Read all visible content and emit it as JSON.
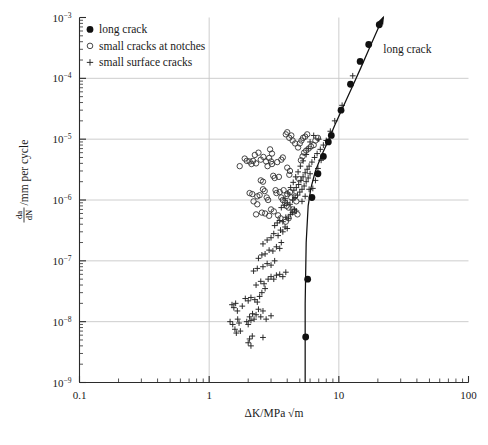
{
  "chart_data": {
    "type": "scatter",
    "title": "",
    "xlabel": "ΔK/MPa √m",
    "ylabel": "da/dN / mm per cycle",
    "ylabel_numerator": "da",
    "ylabel_denominator": "dN",
    "ylabel_suffix": "/mm per cycle",
    "xscale": "log",
    "yscale": "log",
    "xlim": [
      0.1,
      100
    ],
    "ylim": [
      1e-09,
      0.001
    ],
    "grid": "major-only-light-gray",
    "grid_color": "#c8c8c8",
    "axis_color": "#2b2b2b",
    "xticks": [
      {
        "value": 0.1,
        "label": "0.1"
      },
      {
        "value": 1,
        "label": "1"
      },
      {
        "value": 10,
        "label": "10"
      },
      {
        "value": 100,
        "label": "100"
      }
    ],
    "yticks": [
      {
        "value": 0.001,
        "mantissa": "10",
        "exponent": "−3"
      },
      {
        "value": 0.0001,
        "mantissa": "10",
        "exponent": "−4"
      },
      {
        "value": 1e-05,
        "mantissa": "10",
        "exponent": "−5"
      },
      {
        "value": 1e-06,
        "mantissa": "10",
        "exponent": "−6"
      },
      {
        "value": 1e-07,
        "mantissa": "10",
        "exponent": "−7"
      },
      {
        "value": 1e-08,
        "mantissa": "10",
        "exponent": "−8"
      },
      {
        "value": 1e-09,
        "mantissa": "10",
        "exponent": "−9"
      }
    ],
    "legend": {
      "position": "top-left-inside",
      "entries": [
        {
          "marker": "filled-circle",
          "label": "long crack"
        },
        {
          "marker": "open-circle",
          "label": "small cracks at notches"
        },
        {
          "marker": "plus",
          "label": "small surface cracks"
        }
      ]
    },
    "annotations": [
      {
        "text": "long crack",
        "x": 22.0,
        "y": 0.00026,
        "points_to": "long-crack-curve"
      }
    ],
    "series": [
      {
        "name": "long crack",
        "marker": "filled-circle",
        "points": [
          [
            5.55,
            5.6e-09
          ],
          [
            5.75,
            5e-08
          ],
          [
            6.2,
            1.1e-06
          ],
          [
            6.9,
            2.7e-06
          ],
          [
            7.6,
            5.2e-06
          ],
          [
            8.3,
            9e-06
          ],
          [
            8.75,
            1.15e-05
          ],
          [
            10.4,
            3e-05
          ],
          [
            12.3,
            8e-05
          ],
          [
            14.6,
            0.00019
          ],
          [
            17.0,
            0.00036
          ],
          [
            20.5,
            0.00076
          ]
        ]
      },
      {
        "name": "long crack fit curve",
        "marker": "line",
        "points": [
          [
            5.5,
            1e-09
          ],
          [
            5.5,
            2e-08
          ],
          [
            5.6,
            2e-07
          ],
          [
            5.8,
            8e-07
          ],
          [
            6.1,
            1.6e-06
          ],
          [
            6.6,
            3e-06
          ],
          [
            7.3,
            5.2e-06
          ],
          [
            8.2,
            9e-06
          ],
          [
            9.3,
            1.7e-05
          ],
          [
            10.8,
            3.4e-05
          ],
          [
            12.6,
            7e-05
          ],
          [
            14.8,
            0.00015
          ],
          [
            17.4,
            0.00033
          ],
          [
            20.0,
            0.00065
          ],
          [
            22.0,
            0.001
          ]
        ]
      },
      {
        "name": "small cracks at notches",
        "marker": "open-circle",
        "points": [
          [
            1.72,
            3.6e-06
          ],
          [
            1.95,
            4.4e-06
          ],
          [
            2.05,
            4.3e-06
          ],
          [
            2.18,
            4.4e-06
          ],
          [
            2.3,
            4e-06
          ],
          [
            2.5,
            4.6e-06
          ],
          [
            2.62,
            5.1e-06
          ],
          [
            2.75,
            4.3e-06
          ],
          [
            2.82,
            3.6e-06
          ],
          [
            2.9,
            4.9e-06
          ],
          [
            3.0,
            4.3e-06
          ],
          [
            3.05,
            3.9e-06
          ],
          [
            3.12,
            2.5e-06
          ],
          [
            3.2,
            2.3e-06
          ],
          [
            3.25,
            1.45e-06
          ],
          [
            3.3,
            1.3e-06
          ],
          [
            3.45,
            2.4e-06
          ],
          [
            3.5,
            1.35e-06
          ],
          [
            3.6,
            1.1e-06
          ],
          [
            3.7,
            1e-06
          ],
          [
            3.75,
            1.45e-06
          ],
          [
            3.85,
            9e-07
          ],
          [
            3.95,
            8e-07
          ],
          [
            4.0,
            1.25e-06
          ],
          [
            4.1,
            7.5e-07
          ],
          [
            4.2,
            1.35e-06
          ],
          [
            4.3,
            1.1e-06
          ],
          [
            4.4,
            7e-07
          ],
          [
            4.5,
            6.5e-07
          ],
          [
            4.6,
            1.15e-06
          ],
          [
            4.7,
            9.5e-07
          ],
          [
            4.8,
            5.8e-07
          ],
          [
            2.6,
            1.5e-06
          ],
          [
            2.68,
            1.4e-06
          ],
          [
            2.78,
            1.1e-06
          ],
          [
            2.85,
            1e-06
          ],
          [
            2.45,
            1.2e-06
          ],
          [
            2.35,
            1.15e-06
          ],
          [
            2.55,
            6.2e-07
          ],
          [
            2.7,
            6e-07
          ],
          [
            3.0,
            7e-07
          ],
          [
            3.15,
            6.5e-07
          ],
          [
            2.9,
            5.5e-07
          ],
          [
            3.4,
            5.6e-07
          ],
          [
            3.55,
            5e-07
          ],
          [
            4.95,
            2.2e-06
          ],
          [
            5.1,
            4.5e-06
          ],
          [
            5.25,
            5.2e-06
          ],
          [
            5.4,
            6e-06
          ],
          [
            5.6,
            6.5e-06
          ],
          [
            5.85,
            7e-06
          ],
          [
            6.1,
            7.6e-06
          ],
          [
            6.4,
            8e-06
          ],
          [
            4.85,
            7.3e-06
          ],
          [
            5.0,
            8.5e-06
          ],
          [
            5.15,
            9.5e-06
          ],
          [
            5.3,
            1.05e-05
          ],
          [
            5.5,
            1.1e-05
          ],
          [
            5.7,
            1.2e-05
          ],
          [
            4.6,
            8.5e-06
          ],
          [
            4.4,
            9.5e-06
          ],
          [
            4.3,
            1.15e-05
          ],
          [
            4.15,
            1.05e-05
          ],
          [
            4.0,
            1.3e-05
          ],
          [
            3.9,
            1.2e-05
          ],
          [
            2.25,
            5.5e-06
          ],
          [
            2.4,
            6e-06
          ],
          [
            1.88,
            4.8e-06
          ],
          [
            2.12,
            3.9e-06
          ],
          [
            3.35,
            4.2e-06
          ],
          [
            3.6,
            4.6e-06
          ],
          [
            3.7,
            5e-06
          ],
          [
            2.95,
            6.8e-06
          ],
          [
            3.05,
            5.8e-06
          ],
          [
            6.6,
            9.5e-06
          ],
          [
            6.9,
            1.05e-05
          ],
          [
            4.0,
            3.4e-06
          ],
          [
            4.2,
            3e-06
          ],
          [
            4.15,
            2.6e-06
          ],
          [
            2.05,
            1.3e-06
          ],
          [
            2.15,
            1.25e-06
          ],
          [
            2.3,
            5.8e-07
          ],
          [
            3.9,
            4.4e-07
          ],
          [
            4.1,
            5e-07
          ],
          [
            2.2,
            9.5e-07
          ],
          [
            2.35,
            8.5e-07
          ],
          [
            2.5,
            2.1e-06
          ],
          [
            2.6,
            2e-06
          ]
        ]
      },
      {
        "name": "small surface cracks",
        "marker": "plus",
        "points": [
          [
            1.52,
            9e-09
          ],
          [
            1.58,
            7.5e-09
          ],
          [
            1.62,
            6.5e-09
          ],
          [
            1.66,
            1.1e-08
          ],
          [
            1.7,
            9.5e-09
          ],
          [
            1.74,
            7e-09
          ],
          [
            1.95,
            1e-08
          ],
          [
            2.0,
            9e-09
          ],
          [
            2.05,
            1.2e-08
          ],
          [
            2.1,
            1.05e-08
          ],
          [
            2.16,
            1.35e-08
          ],
          [
            2.22,
            1.1e-08
          ],
          [
            2.3,
            1.3e-08
          ],
          [
            2.4,
            1.6e-08
          ],
          [
            2.5,
            1.2e-08
          ],
          [
            2.6,
            1.5e-08
          ],
          [
            2.75,
            1.1e-08
          ],
          [
            3.0,
            1.25e-08
          ],
          [
            2.25,
            2.3e-08
          ],
          [
            2.35,
            2.1e-08
          ],
          [
            2.45,
            2.6e-08
          ],
          [
            2.1,
            2.5e-08
          ],
          [
            2.0,
            2.2e-08
          ],
          [
            2.55,
            3e-08
          ],
          [
            2.7,
            3.5e-08
          ],
          [
            2.3,
            4e-08
          ],
          [
            2.5,
            4.6e-08
          ],
          [
            2.65,
            4.2e-08
          ],
          [
            2.85,
            5e-08
          ],
          [
            3.0,
            5.5e-08
          ],
          [
            3.15,
            5e-08
          ],
          [
            3.3,
            5.8e-08
          ],
          [
            3.5,
            6e-08
          ],
          [
            3.7,
            5.5e-08
          ],
          [
            3.9,
            6.5e-08
          ],
          [
            2.2,
            6.8e-08
          ],
          [
            2.35,
            7.5e-08
          ],
          [
            2.6,
            8e-08
          ],
          [
            2.8,
            9e-08
          ],
          [
            3.0,
            8.5e-08
          ],
          [
            3.2,
            1e-07
          ],
          [
            2.4,
            1.1e-07
          ],
          [
            2.55,
            1.25e-07
          ],
          [
            2.7,
            1.3e-07
          ],
          [
            2.9,
            1.5e-07
          ],
          [
            3.1,
            1.45e-07
          ],
          [
            3.3,
            1.7e-07
          ],
          [
            3.5,
            1.6e-07
          ],
          [
            3.6,
            2e-07
          ],
          [
            2.6,
            1.9e-07
          ],
          [
            2.8,
            2.2e-07
          ],
          [
            3.0,
            2.4e-07
          ],
          [
            3.15,
            2.8e-07
          ],
          [
            3.4,
            2.6e-07
          ],
          [
            3.55,
            3.2e-07
          ],
          [
            3.7,
            3e-07
          ],
          [
            3.85,
            3.6e-07
          ],
          [
            4.0,
            3.4e-07
          ],
          [
            3.2,
            3.8e-07
          ],
          [
            3.35,
            4.2e-07
          ],
          [
            3.5,
            4.6e-07
          ],
          [
            3.7,
            4.4e-07
          ],
          [
            3.9,
            5.2e-07
          ],
          [
            4.1,
            5e-07
          ],
          [
            4.25,
            5.8e-07
          ],
          [
            4.4,
            6.2e-07
          ],
          [
            4.55,
            7e-07
          ],
          [
            4.7,
            6.6e-07
          ],
          [
            3.6,
            7.5e-07
          ],
          [
            3.8,
            8.2e-07
          ],
          [
            4.0,
            9e-07
          ],
          [
            4.2,
            8.5e-07
          ],
          [
            4.4,
            1e-06
          ],
          [
            4.6,
            1.1e-06
          ],
          [
            4.8,
            1.2e-06
          ],
          [
            5.0,
            1.35e-06
          ],
          [
            5.2,
            1.5e-06
          ],
          [
            5.4,
            1.7e-06
          ],
          [
            5.6,
            2e-06
          ],
          [
            5.8,
            2.3e-06
          ],
          [
            6.0,
            2.7e-06
          ],
          [
            4.5,
            1.45e-06
          ],
          [
            4.7,
            1.6e-06
          ],
          [
            4.9,
            1.8e-06
          ],
          [
            5.1,
            2.1e-06
          ],
          [
            5.3,
            2.4e-06
          ],
          [
            5.5,
            2.8e-06
          ],
          [
            5.7,
            3.2e-06
          ],
          [
            5.9,
            3.6e-06
          ],
          [
            6.2,
            4.2e-06
          ],
          [
            6.5,
            5e-06
          ],
          [
            6.8,
            5.8e-06
          ],
          [
            7.2,
            6.8e-06
          ],
          [
            7.6,
            8e-06
          ],
          [
            8.0,
            9.5e-06
          ],
          [
            9.3,
            2e-05
          ],
          [
            10.6,
            3.6e-05
          ],
          [
            12.8,
            0.00011
          ],
          [
            8.6,
            1.35e-05
          ],
          [
            7.0,
            1e-05
          ],
          [
            6.4,
            1.15e-05
          ],
          [
            6.0,
            9e-06
          ],
          [
            5.8,
            7e-06
          ],
          [
            5.6,
            5.6e-06
          ],
          [
            5.3,
            4.4e-06
          ],
          [
            5.05,
            3.6e-06
          ],
          [
            4.85,
            2.9e-06
          ],
          [
            4.65,
            2.4e-06
          ],
          [
            4.45,
            1.95e-06
          ],
          [
            4.25,
            1.6e-06
          ],
          [
            4.05,
            1.3e-06
          ],
          [
            3.85,
            1.05e-06
          ],
          [
            2.0,
            4.5e-09
          ],
          [
            2.05,
            5.2e-09
          ],
          [
            2.1,
            4e-09
          ],
          [
            2.15,
            5.8e-09
          ],
          [
            2.6,
            5.5e-09
          ],
          [
            1.5,
            1.9e-08
          ],
          [
            1.55,
            1.7e-08
          ],
          [
            1.6,
            2e-08
          ],
          [
            1.65,
            1.5e-08
          ],
          [
            1.8,
            1.8e-08
          ],
          [
            1.9,
            2.4e-08
          ],
          [
            1.45,
            1e-08
          ],
          [
            6.3,
            1.55e-06
          ],
          [
            6.6,
            2.1e-06
          ],
          [
            6.9,
            3.3e-06
          ],
          [
            7.3,
            4.5e-06
          ],
          [
            5.2,
            9.5e-07
          ],
          [
            5.5,
            1.15e-06
          ],
          [
            5.9,
            1.5e-06
          ]
        ]
      }
    ]
  }
}
